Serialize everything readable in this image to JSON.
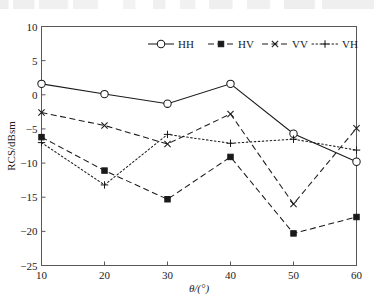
{
  "chart_data": {
    "type": "line",
    "title": "",
    "xlabel": "θ/(°)",
    "ylabel": "RCS/dBsm",
    "x": [
      10,
      20,
      30,
      40,
      50,
      60
    ],
    "categories": [
      "10",
      "20",
      "30",
      "40",
      "50",
      "60"
    ],
    "xlim": [
      10,
      60
    ],
    "ylim": [
      -25,
      10
    ],
    "xticks": [
      "10",
      "20",
      "30",
      "40",
      "50",
      "60"
    ],
    "yticks": [
      "10",
      "5",
      "0",
      "−5",
      "−10",
      "−15",
      "−20",
      "−25"
    ],
    "grid": false,
    "legend_position": "top-center",
    "series": [
      {
        "name": "HH",
        "marker": "circle-open",
        "linestyle": "solid",
        "color": "#1a1a1a",
        "values": [
          1.6,
          0.1,
          -1.3,
          1.6,
          -5.7,
          -9.8
        ]
      },
      {
        "name": "HV",
        "marker": "square-filled",
        "linestyle": "dashed",
        "color": "#1a1a1a",
        "values": [
          -6.2,
          -11.1,
          -15.3,
          -9.1,
          -20.3,
          -17.9
        ]
      },
      {
        "name": "VV",
        "marker": "cross-x",
        "linestyle": "dashed",
        "color": "#1a1a1a",
        "values": [
          -2.6,
          -4.5,
          -7.2,
          -2.8,
          -16.0,
          -4.9
        ]
      },
      {
        "name": "VH",
        "marker": "plus",
        "linestyle": "dotted",
        "color": "#1a1a1a",
        "values": [
          -7.0,
          -13.2,
          -5.8,
          -7.1,
          -6.5,
          -8.1
        ]
      }
    ]
  },
  "legend": {
    "entries": [
      {
        "label": "HH"
      },
      {
        "label": "HV"
      },
      {
        "label": "VV"
      },
      {
        "label": "VH"
      }
    ]
  }
}
